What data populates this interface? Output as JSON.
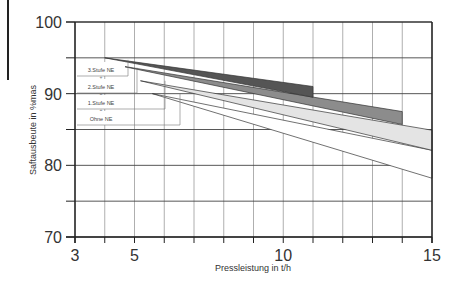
{
  "chart_data": {
    "type": "area",
    "title": "",
    "xlabel": "Pressleistung in t/h",
    "ylabel": "Saftausbeute in %mas",
    "xlim": [
      3,
      15
    ],
    "ylim": [
      70,
      100
    ],
    "x_ticks": [
      3,
      5,
      10,
      15
    ],
    "y_ticks": [
      70,
      80,
      90,
      100
    ],
    "x_grid_step": 1,
    "y_grid_step": 5,
    "grid": true,
    "legend_position": "inside-left",
    "series": [
      {
        "name": "3.Stufe NE",
        "fill": "#555555",
        "upper": [
          [
            4,
            95.0
          ],
          [
            11,
            91.0
          ]
        ],
        "lower": [
          [
            4,
            95.0
          ],
          [
            11,
            89.5
          ]
        ]
      },
      {
        "name": "2.Stufe NE",
        "fill": "#8c8c8c",
        "upper": [
          [
            4.5,
            93.9
          ],
          [
            14,
            87.5
          ]
        ],
        "lower": [
          [
            4.5,
            93.9
          ],
          [
            14,
            85.7
          ]
        ]
      },
      {
        "name": "1.Stufe NE",
        "fill": "#e4e4e4",
        "upper": [
          [
            5.2,
            91.8
          ],
          [
            15,
            84.9
          ]
        ],
        "lower": [
          [
            5.2,
            91.8
          ],
          [
            15,
            82.1
          ]
        ]
      },
      {
        "name": "Ohne NE",
        "fill": "#ffffff",
        "upper": [
          [
            5.6,
            90.0
          ],
          [
            15,
            82.1
          ]
        ],
        "lower": [
          [
            5.6,
            90.0
          ],
          [
            15,
            78.2
          ]
        ]
      }
    ]
  },
  "axes": {
    "x_label": "Pressleistung in t/h",
    "y_label": "Saftausbeute in %mas",
    "x_tick_labels": [
      "3",
      "5",
      "10",
      "15"
    ],
    "y_tick_labels": [
      "70",
      "80",
      "90",
      "100"
    ]
  },
  "legend": [
    "3.Stufe NE",
    "2.Stufe NE",
    "1.Stufe NE",
    "Ohne NE"
  ]
}
